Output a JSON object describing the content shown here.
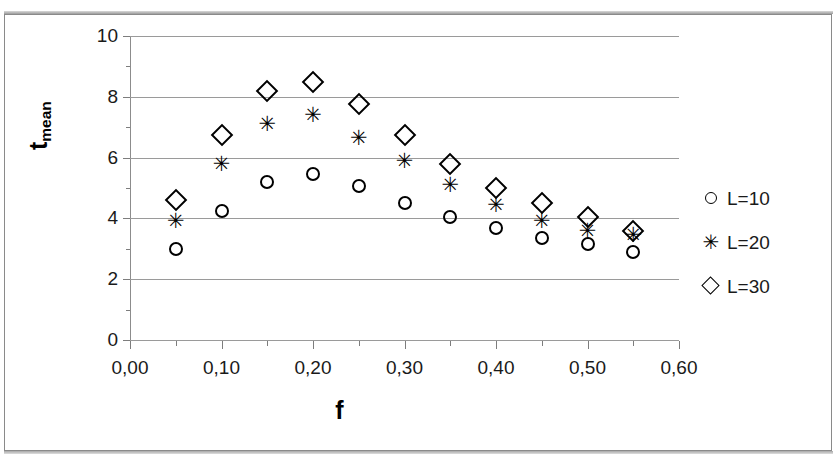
{
  "chart_data": {
    "type": "scatter",
    "title": "",
    "xlabel": "f",
    "ylabel": "t_mean",
    "ylabel_base": "t",
    "ylabel_sub": "mean",
    "xlim": [
      0.0,
      0.6
    ],
    "ylim": [
      0,
      10
    ],
    "grid": true,
    "grid_axis": "y",
    "legend_position": "right",
    "decimal_separator": ",",
    "x_ticks": [
      0.0,
      0.1,
      0.2,
      0.3,
      0.4,
      0.5,
      0.6
    ],
    "x_tick_labels": [
      "0,00",
      "0,10",
      "0,20",
      "0,30",
      "0,40",
      "0,50",
      "0,60"
    ],
    "x_minor_ticks": [
      0.05,
      0.15,
      0.25,
      0.35,
      0.45,
      0.55
    ],
    "y_ticks": [
      0,
      2,
      4,
      6,
      8,
      10
    ],
    "y_tick_labels": [
      "0",
      "2",
      "4",
      "6",
      "8",
      "10"
    ],
    "y_minor_ticks": [
      1,
      3,
      5,
      7,
      9
    ],
    "x": [
      0.05,
      0.1,
      0.15,
      0.2,
      0.25,
      0.3,
      0.35,
      0.4,
      0.45,
      0.5,
      0.55
    ],
    "series": [
      {
        "name": "L=10",
        "marker": "circle",
        "color": "#000000",
        "values": [
          3.0,
          4.25,
          5.2,
          5.45,
          5.05,
          4.5,
          4.05,
          3.7,
          3.35,
          3.15,
          2.9
        ]
      },
      {
        "name": "L=20",
        "marker": "star",
        "color": "#000000",
        "values": [
          3.9,
          5.8,
          7.1,
          7.4,
          6.65,
          5.9,
          5.1,
          4.45,
          3.9,
          3.6,
          3.45
        ]
      },
      {
        "name": "L=30",
        "marker": "diamond",
        "color": "#000000",
        "values": [
          4.6,
          6.75,
          8.2,
          8.5,
          7.75,
          6.75,
          5.8,
          5.0,
          4.5,
          4.05,
          3.6
        ]
      }
    ]
  },
  "legend": {
    "items": [
      {
        "label": "L=10",
        "marker": "circle"
      },
      {
        "label": "L=20",
        "marker": "star"
      },
      {
        "label": "L=30",
        "marker": "diamond"
      }
    ]
  },
  "star_glyph": "✳"
}
